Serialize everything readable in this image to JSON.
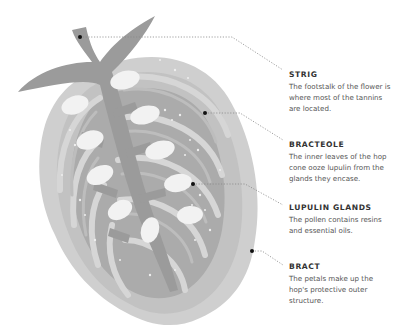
{
  "diagram": {
    "colors": {
      "background": "#ffffff",
      "stem": "#9b9b9b",
      "bract_outer": "#c9c9c9",
      "bract_mid": "#b3b3b3",
      "bracteole_fill": "#a4a4a4",
      "lupulin_gland": "#f2f2f2",
      "leader_line": "#888888",
      "marker_dot": "#111111",
      "title_text": "#333333",
      "body_text": "#555555"
    },
    "labels": [
      {
        "id": "strig",
        "title": "STRIG",
        "description": "The footstalk of the flower is where most of the tannins are located.",
        "lines": [
          "The footstalk of the flower",
          "is where most of the tannins",
          "are located."
        ],
        "marker": [
          80,
          37
        ]
      },
      {
        "id": "bracteole",
        "title": "BRACTEOLE",
        "description": "The inner leaves of the hop cone ooze lupulin from the glands they encase.",
        "lines": [
          "The inner leaves of the hop",
          "cone ooze lupulin from the",
          "glands they encase."
        ],
        "marker": [
          205,
          113
        ]
      },
      {
        "id": "lupulin-glands",
        "title": "LUPULIN GLANDS",
        "description": "The pollen contains resins and essential oils.",
        "lines": [
          "The pollen contains resins",
          "and essential oils."
        ],
        "marker": [
          193,
          184
        ]
      },
      {
        "id": "bract",
        "title": "BRACT",
        "description": "The petals make up the hop's protective outer structure.",
        "lines": [
          "The petals make up the hop's",
          "protective outer structure."
        ],
        "marker": [
          252,
          251
        ]
      }
    ]
  }
}
